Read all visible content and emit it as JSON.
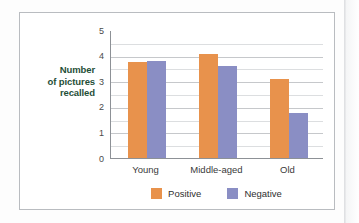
{
  "figure": {
    "background_color": "#ffffff",
    "border_color": "#b9bcc0"
  },
  "chart_data": {
    "type": "bar",
    "title": "",
    "subtitle": "",
    "xlabel": "",
    "ylabel": "Number of pictures recalled",
    "ylabel_lines": [
      "Number",
      "of pictures",
      "recalled"
    ],
    "ylabel_color": "#1f4f38",
    "categories": [
      "Young",
      "Middle-aged",
      "Old"
    ],
    "series": [
      {
        "name": "Positive",
        "color": "#e8924c",
        "values": [
          3.75,
          4.05,
          3.1
        ]
      },
      {
        "name": "Negative",
        "color": "#8a8ec4",
        "values": [
          3.8,
          3.6,
          1.75
        ]
      }
    ],
    "ylim": [
      0,
      5
    ],
    "ytick_labels": [
      "5",
      "4",
      "3",
      "2",
      "1",
      "0"
    ],
    "ytick_values": [
      5,
      4,
      3,
      2,
      1,
      0
    ],
    "minor_gridlines": [
      4.5,
      3.5,
      2.5,
      1.5,
      0.5
    ],
    "grid": true,
    "grid_color": "#c6c8cb",
    "legend_position": "bottom",
    "legend": [
      {
        "label": "Positive",
        "color": "#e8924c"
      },
      {
        "label": "Negative",
        "color": "#8a8ec4"
      }
    ]
  }
}
